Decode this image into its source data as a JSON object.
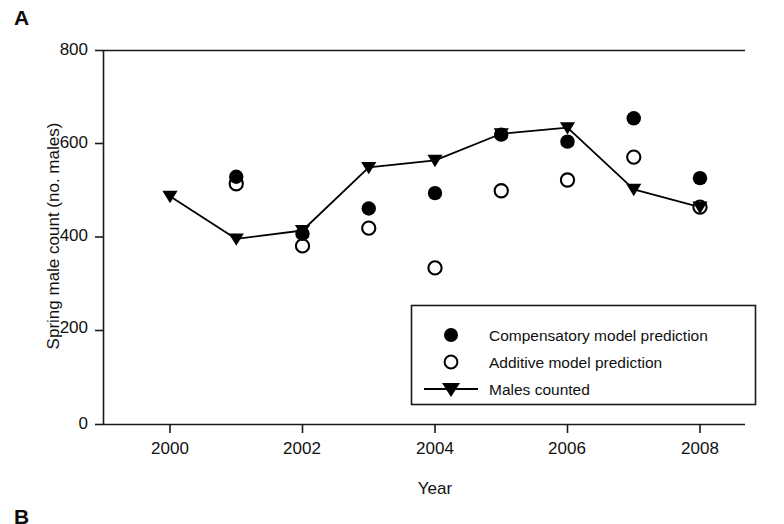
{
  "figure": {
    "panel_label": "A",
    "next_panel_label": "B"
  },
  "chart_data": {
    "type": "scatter",
    "title": "",
    "xlabel": "Year",
    "ylabel": "Spring male count (no. males)",
    "x": [
      2000,
      2001,
      2002,
      2003,
      2004,
      2005,
      2006,
      2007,
      2008
    ],
    "xlim": [
      1999.5,
      2008.7
    ],
    "ylim": [
      0,
      800
    ],
    "xticks": [
      2000,
      2002,
      2004,
      2006,
      2008
    ],
    "xtick_labels": [
      "2000",
      "2002",
      "2004",
      "2006",
      "2008"
    ],
    "yticks": [
      0,
      200,
      400,
      600,
      800
    ],
    "ytick_labels": [
      "0",
      "200",
      "400",
      "600",
      "800"
    ],
    "grid": false,
    "legend_position": "lower right",
    "series": [
      {
        "name": "Compensatory model prediction",
        "marker": "filled-circle",
        "color": "#000000",
        "x": [
          2001,
          2002,
          2003,
          2004,
          2005,
          2006,
          2007,
          2008
        ],
        "values": [
          530,
          408,
          462,
          495,
          620,
          605,
          655,
          527
        ]
      },
      {
        "name": "Additive model prediction",
        "marker": "open-circle",
        "color": "#000000",
        "x": [
          2001,
          2002,
          2003,
          2004,
          2005,
          2006,
          2007,
          2008
        ],
        "values": [
          515,
          382,
          420,
          335,
          500,
          523,
          572,
          465
        ]
      },
      {
        "name": "Males counted",
        "marker": "filled-triangle-down",
        "line": true,
        "color": "#000000",
        "x": [
          2000,
          2001,
          2002,
          2003,
          2004,
          2005,
          2006,
          2007,
          2008
        ],
        "values": [
          488,
          397,
          415,
          550,
          565,
          622,
          635,
          503,
          465
        ]
      }
    ]
  },
  "legend": {
    "items": [
      {
        "label": "Compensatory model prediction",
        "marker": "filled-circle"
      },
      {
        "label": "Additive model prediction",
        "marker": "open-circle"
      },
      {
        "label": "Males counted",
        "marker": "line-triangle"
      }
    ]
  },
  "colors": {
    "ink": "#000000",
    "axis": "#1a1a1a",
    "background": "#ffffff"
  }
}
